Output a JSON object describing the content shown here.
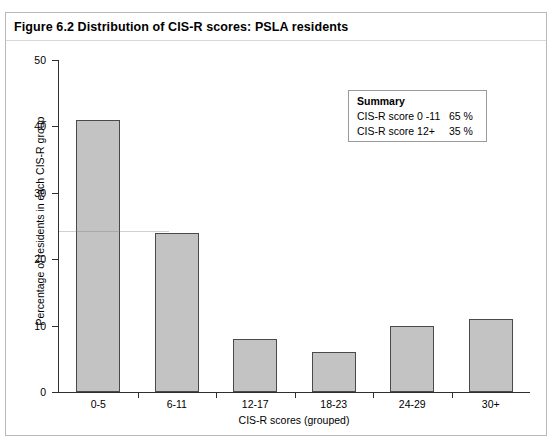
{
  "figure": {
    "title": "Figure 6.2  Distribution of CIS-R scores: PSLA residents"
  },
  "summary": {
    "heading": "Summary",
    "rows": [
      {
        "label": "CIS-R score 0 -11",
        "value": "65 %"
      },
      {
        "label": "CIS-R score 12+",
        "value": "35 %"
      }
    ]
  },
  "chart_data": {
    "type": "bar",
    "title": "Figure 6.2  Distribution of CIS-R scores: PSLA residents",
    "categories": [
      "0-5",
      "6-11",
      "12-17",
      "18-23",
      "24-29",
      "30+"
    ],
    "values": [
      41,
      24,
      8,
      6,
      10,
      11
    ],
    "xlabel": "CIS-R scores (grouped)",
    "ylabel": "Percentage of residents in each CIS-R group",
    "ylim": [
      0,
      50
    ],
    "yticks": [
      "0",
      "10",
      "20",
      "30",
      "40",
      "50"
    ],
    "grid": false,
    "legend": "none",
    "bar_color": "#c3c3c3",
    "bar_edge_color": "#4a4a4a"
  }
}
